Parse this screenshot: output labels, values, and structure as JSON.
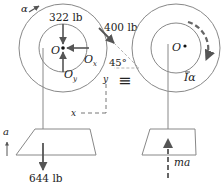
{
  "diagram": {
    "type": "free-body and kinetic diagram",
    "left_panel": {
      "name": "free-body diagram",
      "pulley_center_label": "O",
      "angular_accel_label": "α",
      "forces": {
        "weight_pulley": "322 lb",
        "applied_force": "400 lb",
        "reaction_x": "O",
        "reaction_x_sub": "x",
        "reaction_y": "O",
        "reaction_y_sub": "y",
        "weight_block": "644 lb"
      },
      "angle_label": "45°",
      "axis_x_label": "x",
      "axis_y_label": "y",
      "block_accel_label": "a"
    },
    "equivalence_symbol": "≡",
    "right_panel": {
      "name": "kinetic diagram",
      "pulley_center_label": "O",
      "moment_label": "Iα",
      "inertia_bar_label": "I",
      "alpha_label": "α",
      "block_effective_force": "ma"
    },
    "colors": {
      "line": "#777777",
      "arrow": "#555555",
      "text": "#222222",
      "background": "#ffffff"
    }
  }
}
